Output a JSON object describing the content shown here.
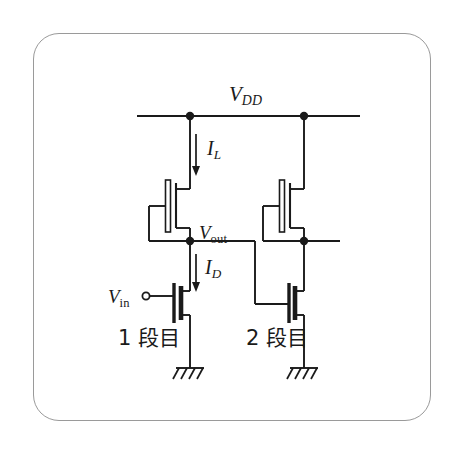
{
  "figure": {
    "frame_color": "#9a9a9a",
    "wire_color": "#1a1a1a",
    "background": "#ffffff"
  },
  "labels": {
    "vdd": {
      "base": "V",
      "sub": "DD",
      "sub_style": "italic"
    },
    "il": {
      "base": "I",
      "sub": "L",
      "sub_style": "italic"
    },
    "vout": {
      "base": "V",
      "sub": "out",
      "sub_style": "upright"
    },
    "id": {
      "base": "I",
      "sub": "D",
      "sub_style": "italic"
    },
    "vin": {
      "base": "V",
      "sub": "in",
      "sub_style": "upright"
    },
    "stage1": "1 段目",
    "stage2": "2 段目"
  },
  "nodes": [
    {
      "name": "vdd-node-stage1",
      "x": 190,
      "y": 116
    },
    {
      "name": "vdd-node-stage2",
      "x": 304,
      "y": 116
    },
    {
      "name": "vout-node",
      "x": 190,
      "y": 241
    },
    {
      "name": "stage2-output-node",
      "x": 304,
      "y": 241
    }
  ],
  "terminals": [
    {
      "name": "vin-terminal",
      "x": 146,
      "y": 296,
      "r": 3.6
    }
  ],
  "rails": {
    "vdd": {
      "y": 116,
      "x1": 137,
      "x2": 360
    }
  },
  "arrows": [
    {
      "name": "il-current-arrow",
      "x": 196,
      "y1": 134,
      "y2": 172,
      "direction": "down"
    },
    {
      "name": "id-current-arrow",
      "x": 196,
      "y1": 254,
      "y2": 288,
      "direction": "down"
    }
  ],
  "transistors": [
    {
      "name": "load-mosfet-stage1",
      "type": "nmos-depletion-load",
      "gate_style": "hollow-bar",
      "diode_connected": true
    },
    {
      "name": "driver-mosfet-stage1",
      "type": "nmos-enhancement-driver",
      "gate_style": "solid-bar",
      "diode_connected": false
    },
    {
      "name": "load-mosfet-stage2",
      "type": "nmos-depletion-load",
      "gate_style": "hollow-bar",
      "diode_connected": true
    },
    {
      "name": "driver-mosfet-stage2",
      "type": "nmos-enhancement-driver",
      "gate_style": "solid-bar",
      "diode_connected": false
    }
  ],
  "grounds": [
    {
      "name": "ground-stage1",
      "x": 190,
      "y": 368
    },
    {
      "name": "ground-stage2",
      "x": 304,
      "y": 368
    }
  ]
}
